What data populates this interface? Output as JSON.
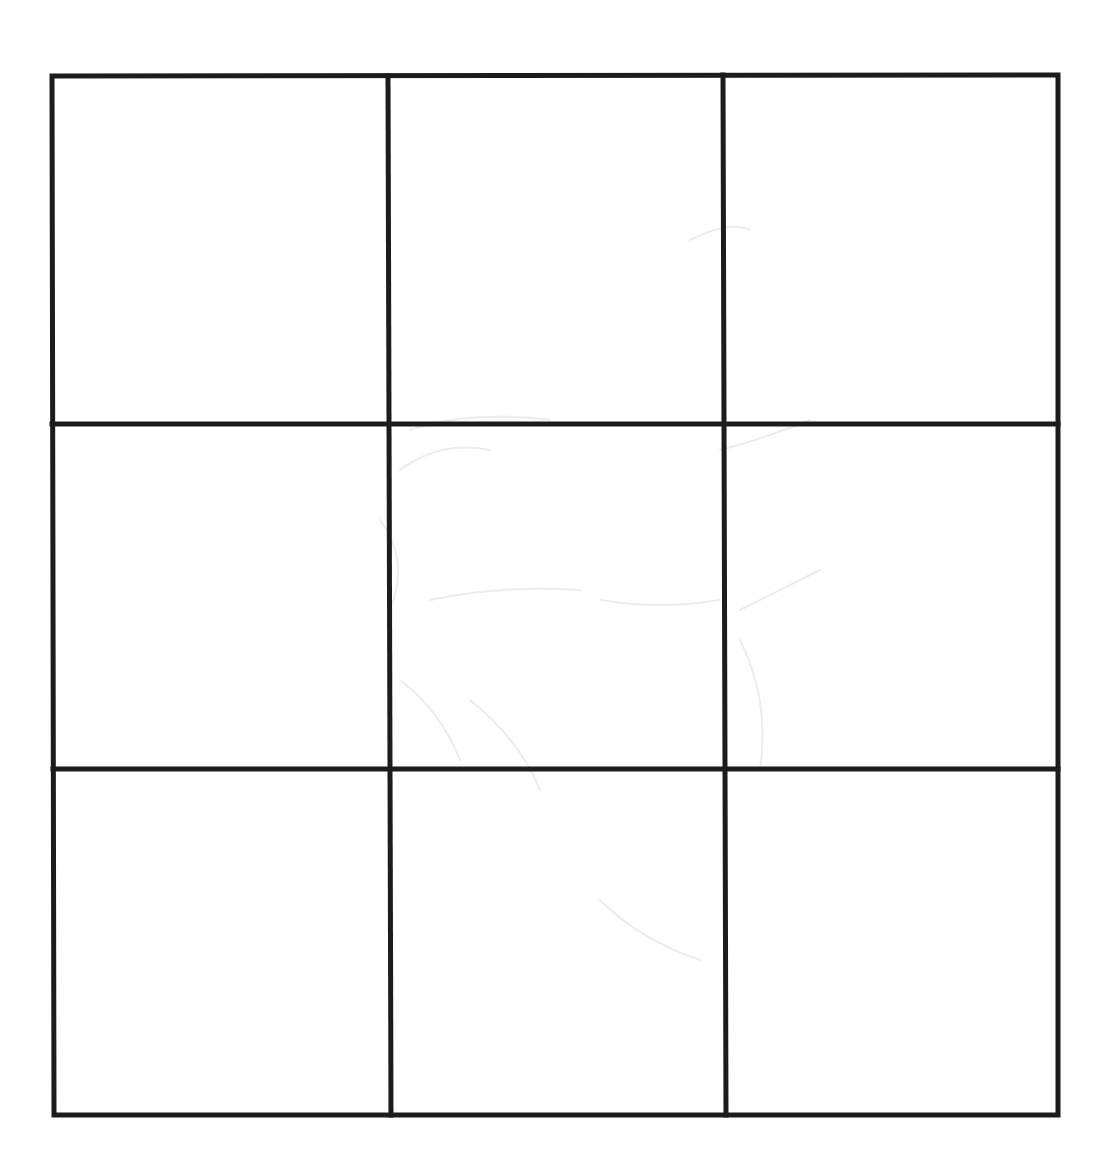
{
  "canvas": {
    "width": 1116,
    "height": 1176,
    "background": "#ffffff"
  },
  "grid": {
    "rows": 3,
    "columns": 3,
    "line_color": "#1c1c1c",
    "line_width": 5,
    "outer_border": {
      "top_left": [
        52,
        76
      ],
      "top_right": [
        1058,
        75
      ],
      "bottom_right": [
        1058,
        1115
      ],
      "bottom_left": [
        54,
        1115
      ]
    },
    "vertical_dividers": [
      {
        "top": [
          388,
          76
        ],
        "bottom": [
          391,
          1115
        ]
      },
      {
        "top": [
          723,
          75
        ],
        "bottom": [
          726,
          1115
        ]
      }
    ],
    "horizontal_dividers": [
      {
        "left": [
          52,
          424
        ],
        "right": [
          1058,
          424
        ]
      },
      {
        "left": [
          53,
          769
        ],
        "right": [
          1058,
          769
        ]
      }
    ],
    "cells": [
      {
        "row": 1,
        "col": 1,
        "content": ""
      },
      {
        "row": 1,
        "col": 2,
        "content": ""
      },
      {
        "row": 1,
        "col": 3,
        "content": ""
      },
      {
        "row": 2,
        "col": 1,
        "content": ""
      },
      {
        "row": 2,
        "col": 2,
        "content": ""
      },
      {
        "row": 2,
        "col": 3,
        "content": ""
      },
      {
        "row": 3,
        "col": 1,
        "content": ""
      },
      {
        "row": 3,
        "col": 2,
        "content": ""
      },
      {
        "row": 3,
        "col": 3,
        "content": ""
      }
    ]
  },
  "background_marks": {
    "description": "faint illegible bleed-through strokes",
    "color": "#ececec"
  }
}
